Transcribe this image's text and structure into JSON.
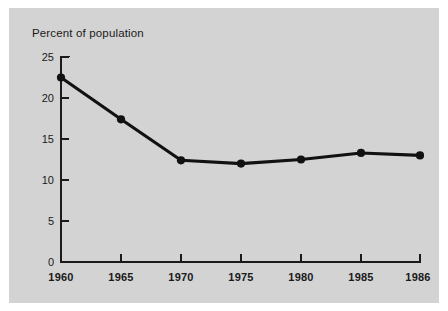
{
  "chart_data": {
    "type": "line",
    "title": "Percent of population",
    "subtitle": "",
    "xlabel": "",
    "ylabel": "",
    "categories": [
      "1960",
      "1965",
      "1970",
      "1975",
      "1980",
      "1985",
      "1986"
    ],
    "values": [
      22.5,
      17.4,
      12.4,
      12.0,
      12.5,
      13.3,
      13.0
    ],
    "series": [
      {
        "name": "Percent of population",
        "values": [
          22.5,
          17.4,
          12.4,
          12.0,
          12.5,
          13.3,
          13.0
        ]
      }
    ],
    "ylim": [
      0,
      25
    ],
    "y_ticks": [
      "0",
      "5",
      "10",
      "15",
      "20",
      "25"
    ],
    "x_ticks": [
      "1960",
      "1965",
      "1970",
      "1975",
      "1980",
      "1985",
      "1986"
    ],
    "grid": false,
    "legend": false,
    "legend_position": "none",
    "axis_spacing": "categorical-even",
    "colors": {
      "panel_background": "#d3d3d3",
      "outer_background": "#ffffff",
      "line": "#111111",
      "marker": "#111111",
      "axis": "#1a1a1a",
      "text": "#1a1a1a"
    }
  }
}
